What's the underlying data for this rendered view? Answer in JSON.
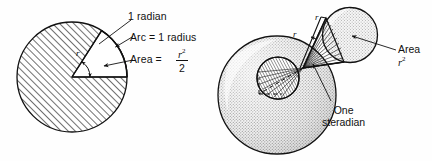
{
  "figure": {
    "background_color": "#fefefe",
    "ink_color": "#111111",
    "panels": [
      {
        "id": "radian-panel",
        "name": "radian-diagram",
        "description": "Hatched circle with a blank sector of one radian"
      },
      {
        "id": "steradian-panel",
        "name": "steradian-diagram",
        "description": "Stippled sphere with hatched patch, cone, and small stippled sphere"
      }
    ]
  },
  "left": {
    "labels": {
      "one_radian": "1 radian",
      "arc": "Arc = 1 radius",
      "area_prefix": "Area =",
      "area_numerator": "r",
      "area_numerator_exponent": "2",
      "area_denominator": "2",
      "radius_symbol": "r"
    }
  },
  "right": {
    "labels": {
      "radius_upper": "r",
      "radius_lower": "r",
      "area_word": "Area",
      "area_value": "r",
      "area_value_exponent": "2",
      "one_steradian_line1": "One",
      "one_steradian_line2": "steradian"
    }
  },
  "colors": {
    "ink": "#111111",
    "hatch": "#2b2b2b",
    "stipple": "#9a9a9a",
    "sphere_fill": "#e3e3e3",
    "paper": "#fefefe"
  }
}
